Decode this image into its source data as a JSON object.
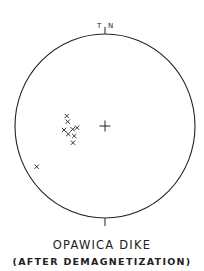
{
  "figure": {
    "title": "OPAWICA DIKE",
    "subtitle": "(AFTER DEMAGNETIZATION)",
    "north_marker_left": "T",
    "north_marker_right": "N",
    "center_marker": "+",
    "point_marker": "x"
  },
  "chart_data": {
    "type": "scatter",
    "projection": "stereonet (equal-area, lower hemisphere)",
    "title": "OPAWICA DIKE",
    "subtitle": "(AFTER DEMAGNETIZATION)",
    "annotations": [
      "T",
      "N",
      "+ (center)"
    ],
    "points_pixel": [
      {
        "x": 66.7,
        "y": 116.0
      },
      {
        "x": 67.7,
        "y": 121.7
      },
      {
        "x": 64.0,
        "y": 130.0
      },
      {
        "x": 68.3,
        "y": 134.0
      },
      {
        "x": 72.7,
        "y": 129.3
      },
      {
        "x": 77.0,
        "y": 127.7
      },
      {
        "x": 74.3,
        "y": 136.0
      },
      {
        "x": 73.0,
        "y": 142.7
      },
      {
        "x": 36.7,
        "y": 166.7
      }
    ],
    "circle": {
      "cx": 105,
      "cy": 126,
      "r": 90
    },
    "colors": {
      "ink": "#222222",
      "background": "#ffffff"
    }
  }
}
